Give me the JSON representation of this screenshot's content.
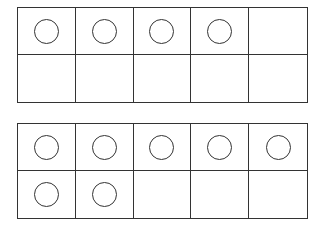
{
  "frames": [
    {
      "name": "ten-frame-top",
      "top": 7,
      "filled_count": 4,
      "cells": [
        1,
        1,
        1,
        1,
        0,
        0,
        0,
        0,
        0,
        0
      ]
    },
    {
      "name": "ten-frame-bottom",
      "top": 123,
      "filled_count": 7,
      "cells": [
        1,
        1,
        1,
        1,
        1,
        1,
        1,
        0,
        0,
        0
      ]
    }
  ],
  "colors": {
    "line": "#333333",
    "background": "#ffffff"
  }
}
